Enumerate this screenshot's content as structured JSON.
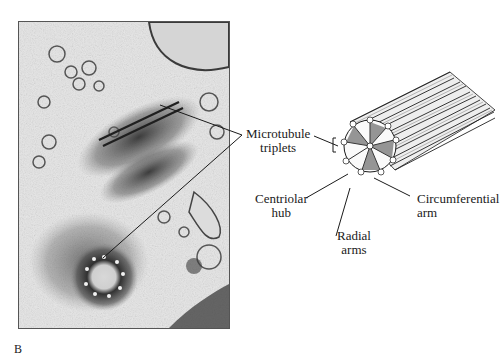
{
  "figure": {
    "panel_letter": "B",
    "micrograph": {
      "description": "Electron micrograph of centrioles (longitudinal and cross sections)"
    },
    "diagram": {
      "description": "3D schematic of a centriole cylinder made of nine microtubule triplets"
    },
    "labels": {
      "microtubule_triplets": [
        "Microtubule",
        "triplets"
      ],
      "centriolar_hub": [
        "Centriolar",
        "hub"
      ],
      "radial_arms": [
        "Radial",
        "arms"
      ],
      "circumferential_arm": [
        "Circumferential",
        "arm"
      ]
    },
    "colors": {
      "ink": "#1a1a1a",
      "paper": "#ffffff",
      "micrograph_bg": "#e9e9e9"
    }
  }
}
